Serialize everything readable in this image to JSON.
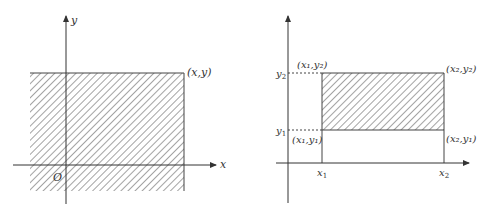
{
  "colors": {
    "line": "#444444",
    "hatch": "#555555",
    "background": "#ffffff"
  },
  "left_diagram": {
    "axis_x_label": "x",
    "axis_y_label": "y",
    "origin_label": "O",
    "corner_label": "(x,y)"
  },
  "right_diagram": {
    "tick_x1": {
      "base": "x",
      "sub": "1"
    },
    "tick_x2": {
      "base": "x",
      "sub": "2"
    },
    "tick_y1": {
      "base": "y",
      "sub": "1"
    },
    "tick_y2": {
      "base": "y",
      "sub": "2"
    },
    "corners": {
      "top_left": "(x₁,y₂)",
      "top_right": "(x₂,y₂)",
      "bottom_left": "(x₁,y₁)",
      "bottom_right": "(x₂,y₁)"
    }
  }
}
